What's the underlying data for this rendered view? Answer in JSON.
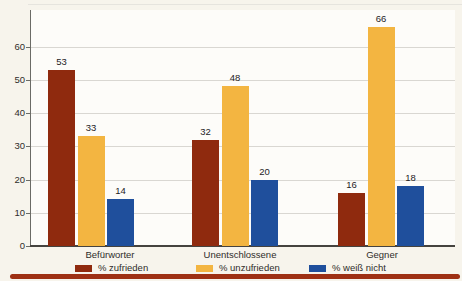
{
  "page": {
    "background": "#f7f4ec",
    "bottom_rule_color": "#9e3014"
  },
  "chart_data": {
    "type": "bar",
    "title": "",
    "xlabel": "",
    "ylabel": "",
    "categories": [
      "Befürworter",
      "Unentschlossene",
      "Gegner"
    ],
    "series": [
      {
        "name": "% zufrieden",
        "color": "#8f2a0e",
        "values": [
          53,
          32,
          16
        ]
      },
      {
        "name": "% unzufrieden",
        "color": "#f3b541",
        "values": [
          33,
          48,
          66
        ]
      },
      {
        "name": "% weiß nicht",
        "color": "#1f4f9c",
        "values": [
          14,
          20,
          18
        ]
      }
    ],
    "ylim": [
      0,
      70
    ],
    "yticks": [
      0,
      10,
      20,
      30,
      40,
      50,
      60
    ],
    "grid": true,
    "legend_position": "bottom",
    "value_labels": true
  }
}
